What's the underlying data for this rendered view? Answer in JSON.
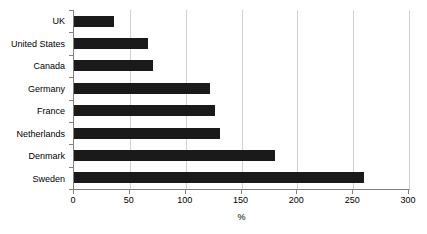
{
  "chart_data": {
    "type": "bar",
    "orientation": "horizontal",
    "title": "",
    "xlabel": "%",
    "ylabel": "",
    "categories": [
      "UK",
      "United States",
      "Canada",
      "Germany",
      "France",
      "Netherlands",
      "Denmark",
      "Sweden"
    ],
    "values": [
      36,
      66,
      71,
      122,
      126,
      131,
      180,
      260
    ],
    "xlim": [
      0,
      300
    ],
    "xticks": [
      0,
      50,
      100,
      150,
      200,
      250,
      300
    ],
    "xtick_labels": [
      "0",
      "50",
      "100",
      "150",
      "200",
      "250",
      "300"
    ],
    "grid": "vertical",
    "legend": "none",
    "bar_color": "#1a1a1a",
    "gridline_color": "#d0d0d0",
    "axis_color": "#808080",
    "background_color": "#ffffff"
  }
}
